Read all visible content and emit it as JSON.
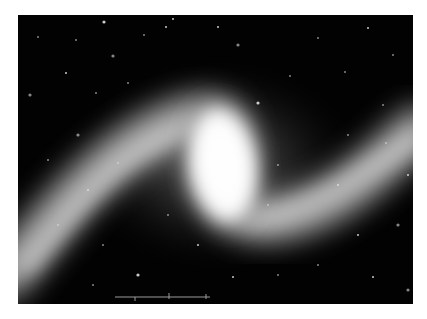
{
  "image": {
    "subject": "barred spiral galaxy",
    "background_color": "#020202",
    "border_color": "#ffffff",
    "core_color": "#ffffff",
    "arm_color": "#cfcfcf"
  },
  "scale_bar": {
    "color": "#9a9a9a"
  },
  "stars": [
    [
      86,
      7
    ],
    [
      20,
      22
    ],
    [
      126,
      20
    ],
    [
      155,
      4
    ],
    [
      58,
      25
    ],
    [
      95,
      41
    ],
    [
      48,
      58
    ],
    [
      78,
      78
    ],
    [
      110,
      68
    ],
    [
      148,
      12
    ],
    [
      220,
      30
    ],
    [
      300,
      23
    ],
    [
      350,
      13
    ],
    [
      327,
      57
    ],
    [
      272,
      61
    ],
    [
      240,
      88
    ],
    [
      375,
      40
    ],
    [
      260,
      150
    ],
    [
      320,
      170
    ],
    [
      368,
      128
    ],
    [
      380,
      210
    ],
    [
      340,
      220
    ],
    [
      300,
      250
    ],
    [
      260,
      260
    ],
    [
      355,
      262
    ],
    [
      390,
      275
    ],
    [
      100,
      148
    ],
    [
      70,
      175
    ],
    [
      40,
      210
    ],
    [
      85,
      230
    ],
    [
      120,
      260
    ],
    [
      75,
      270
    ],
    [
      150,
      200
    ],
    [
      180,
      230
    ],
    [
      30,
      145
    ],
    [
      60,
      120
    ],
    [
      215,
      262
    ],
    [
      250,
      190
    ],
    [
      330,
      120
    ],
    [
      200,
      12
    ],
    [
      12,
      80
    ],
    [
      365,
      90
    ],
    [
      390,
      160
    ]
  ]
}
